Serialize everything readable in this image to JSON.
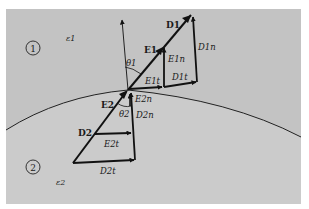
{
  "figure": {
    "type": "diagram",
    "colors": {
      "background": "#ffffff",
      "region1_fill": "#c3c3c3",
      "region2_fill": "#cbcbcb",
      "ink": "#111111"
    },
    "regions": [
      {
        "id": "1",
        "label": "1",
        "permittivity_label": "ε1"
      },
      {
        "id": "2",
        "label": "2",
        "permittivity_label": "ε2"
      }
    ],
    "angles": {
      "theta1": "θ1",
      "theta2": "θ2"
    },
    "vectors": {
      "D1": "D1",
      "E1": "E1",
      "E1n": "E1n",
      "D1n": "D1n",
      "E1t": "E1t",
      "D1t": "D1t",
      "E2": "E2",
      "D2": "D2",
      "E2n": "E2n",
      "D2n": "D2n",
      "E2t": "E2t",
      "D2t": "D2t"
    }
  }
}
